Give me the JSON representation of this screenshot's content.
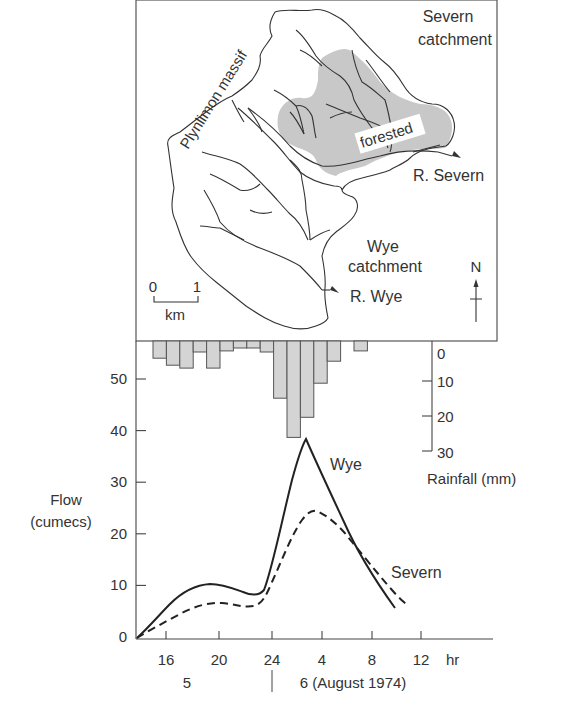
{
  "map": {
    "severn_catchment_label": [
      "Severn",
      "catchment"
    ],
    "wye_catchment_label": [
      "Wye",
      "catchment"
    ],
    "massif_label": "Plynlimon massif",
    "forested_label": "forested",
    "severn_river_label": "R. Severn",
    "wye_river_label": "R. Wye",
    "north_label": "N",
    "scale_bar": {
      "start": "0",
      "end": "1",
      "unit": "km"
    },
    "colors": {
      "forest": "#c8c8c8",
      "lines": "#333333",
      "frame": "#555555"
    }
  },
  "chart_data": [
    {
      "type": "bar",
      "title": "Rainfall",
      "ylabel": "Rainfall (mm)",
      "ylim": [
        0,
        30
      ],
      "y_ticks": [
        "0",
        "10",
        "20",
        "30"
      ],
      "orientation": "inverted (hanging from top)",
      "bar_width_hours": 1.07,
      "x_start_hour_day5": 15.3,
      "values": [
        4.7,
        6.6,
        7.4,
        3.0,
        7.4,
        2.7,
        1.9,
        1.9,
        3.0,
        15.6,
        26.3,
        20.8,
        11.5,
        5.5,
        0,
        2.7
      ],
      "bar_color": "#d4d4d4"
    },
    {
      "type": "line",
      "xlabel": "hr",
      "ylabel": "Flow (cumecs)",
      "ylabel_lines": [
        "Flow",
        "(cumecs)"
      ],
      "ylim": [
        0,
        55
      ],
      "y_ticks": [
        "0",
        "10",
        "20",
        "30",
        "40",
        "50"
      ],
      "x_ticks": [
        "16",
        "20",
        "24",
        "4",
        "8",
        "12"
      ],
      "x_unit": "hr",
      "day_labels": [
        "5",
        "6 (August 1974)"
      ],
      "grid": false,
      "series": [
        {
          "name": "Wye",
          "style": "solid",
          "points_hours_since_day5_00": [
            [
              13.7,
              0
            ],
            [
              16,
              4.5
            ],
            [
              18.5,
              9.0
            ],
            [
              19.5,
              9.6
            ],
            [
              21,
              9.0
            ],
            [
              23,
              7.8
            ],
            [
              24,
              9.5
            ],
            [
              26.7,
              38.3
            ],
            [
              29,
              29
            ],
            [
              31,
              18.5
            ],
            [
              34,
              5.6
            ]
          ],
          "peak": {
            "hour": "~03:00 on 6 Aug",
            "flow": 38
          }
        },
        {
          "name": "Severn",
          "style": "dashed",
          "points_hours_since_day5_00": [
            [
              13.7,
              0
            ],
            [
              16,
              2.5
            ],
            [
              18.5,
              5.5
            ],
            [
              20,
              6.3
            ],
            [
              22,
              5.8
            ],
            [
              23.5,
              6.5
            ],
            [
              25,
              14
            ],
            [
              27.5,
              24.4
            ],
            [
              30,
              20
            ],
            [
              32,
              13
            ],
            [
              35,
              6.2
            ]
          ],
          "peak": {
            "hour": "~03:30 on 6 Aug",
            "flow": 24
          }
        }
      ]
    }
  ]
}
